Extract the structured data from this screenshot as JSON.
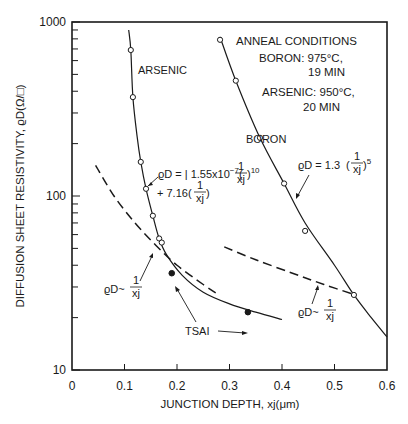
{
  "chart_data": {
    "type": "line",
    "title": "",
    "xlabel": "JUNCTION DEPTH, xj(μm)",
    "ylabel": "DIFFUSION SHEET RESISTIVITY, ϱD(Ω/□)",
    "xlim": [
      0,
      0.6
    ],
    "ylim": [
      10,
      1000
    ],
    "yscale": "log",
    "grid": false,
    "x_ticks": [
      "0",
      "0.1",
      "0.2",
      "0.3",
      "0.4",
      "0.5",
      "0.6"
    ],
    "y_ticks": [
      "10",
      "100",
      "1000"
    ],
    "series": [
      {
        "name": "ARSENIC",
        "style": "solid line with open circles",
        "points": [
          [
            0.112,
            690
          ],
          [
            0.116,
            370
          ],
          [
            0.131,
            157
          ],
          [
            0.141,
            110
          ],
          [
            0.154,
            77
          ],
          [
            0.166,
            57
          ],
          [
            0.171,
            54
          ]
        ],
        "fit_curve": [
          [
            0.108,
            900
          ],
          [
            0.112,
            690
          ],
          [
            0.116,
            370
          ],
          [
            0.124,
            220
          ],
          [
            0.131,
            157
          ],
          [
            0.141,
            110
          ],
          [
            0.154,
            77
          ],
          [
            0.166,
            57
          ],
          [
            0.18,
            46
          ],
          [
            0.21,
            35
          ],
          [
            0.25,
            28
          ],
          [
            0.3,
            24
          ],
          [
            0.35,
            21.5
          ],
          [
            0.4,
            19.5
          ]
        ]
      },
      {
        "name": "BORON",
        "style": "solid line with open circles",
        "points": [
          [
            0.282,
            790
          ],
          [
            0.312,
            460
          ],
          [
            0.358,
            216
          ],
          [
            0.404,
            118
          ],
          [
            0.444,
            63
          ],
          [
            0.537,
            27
          ]
        ],
        "fit_curve": [
          [
            0.282,
            820
          ],
          [
            0.312,
            460
          ],
          [
            0.358,
            216
          ],
          [
            0.404,
            118
          ],
          [
            0.444,
            70
          ],
          [
            0.5,
            40
          ],
          [
            0.537,
            27
          ],
          [
            0.57,
            20
          ],
          [
            0.6,
            15.5
          ]
        ]
      },
      {
        "name": "TSAI",
        "style": "filled circles",
        "points": [
          [
            0.19,
            36
          ],
          [
            0.335,
            21.5
          ]
        ]
      },
      {
        "name": "ϱD ~ 1/xj (arsenic)",
        "style": "dashed",
        "fit_curve": [
          [
            0.045,
            150
          ],
          [
            0.08,
            100
          ],
          [
            0.12,
            70
          ],
          [
            0.16,
            52
          ],
          [
            0.2,
            40
          ],
          [
            0.25,
            31
          ],
          [
            0.28,
            27
          ]
        ]
      },
      {
        "name": "ϱD ~ 1/xj (boron)",
        "style": "dashed",
        "fit_curve": [
          [
            0.29,
            51
          ],
          [
            0.35,
            43
          ],
          [
            0.42,
            36
          ],
          [
            0.48,
            31
          ],
          [
            0.54,
            27
          ]
        ]
      }
    ],
    "annotations": [
      {
        "text": "ARSENIC",
        "x": 0.145,
        "y": 420
      },
      {
        "text": "BORON",
        "x": 0.32,
        "y": 160
      },
      {
        "text": "ϱD = 1.55x10⁻⁷(1/xj)¹⁰ + 7.16(1/xj)",
        "x": 0.17,
        "y": 110
      },
      {
        "text": "ϱD = 1.3(1/xj)⁵",
        "x": 0.43,
        "y": 115
      },
      {
        "text": "ϱD ~ 1/xj",
        "x": 0.1,
        "y": 28
      },
      {
        "text": "ϱD ~ 1/xj",
        "x": 0.5,
        "y": 23
      },
      {
        "text": "TSAI",
        "x": 0.25,
        "y": 21
      }
    ],
    "legend": {
      "position": "upper right",
      "title": "ANNEAL CONDITIONS",
      "entries": [
        "BORON: 975°C, 19 MIN",
        "ARSENIC: 950°C, 20 MIN"
      ]
    }
  },
  "labels": {
    "ylabel": "DIFFUSION SHEET RESISTIVITY, ϱD(Ω/□)",
    "xlabel": "JUNCTION DEPTH, xj(μm)",
    "arsenic": "ARSENIC",
    "boron": "BORON",
    "tsai": "TSAI",
    "cond_title": "ANNEAL CONDITIONS",
    "cond_boron_1": "BORON: 975°C,",
    "cond_boron_2": "19 MIN",
    "cond_arsenic_1": "ARSENIC: 950°C,",
    "cond_arsenic_2": "20 MIN",
    "eq_arsenic_1": "ϱD = | 1.55x10",
    "eq_arsenic_exp": "−7",
    "eq_arsenic_pow": "10",
    "eq_arsenic_2": "+ 7.16",
    "eq_boron": "ϱD = 1.3",
    "eq_boron_pow": "5",
    "rho_sim": "ϱD~",
    "frac_num": "1",
    "frac_den": "xj"
  }
}
